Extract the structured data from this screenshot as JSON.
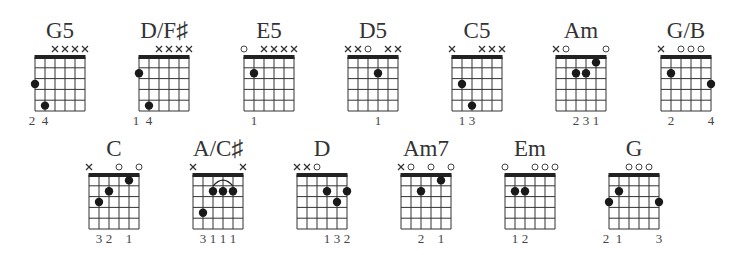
{
  "chart_data": {
    "type": "table",
    "strings": 6,
    "frets_shown": 5,
    "rows": [
      [
        {
          "name": "G5",
          "markers": [
            "",
            "",
            "x",
            "x",
            "x",
            "x"
          ],
          "dots": [
            [
              1,
              3
            ],
            [
              2,
              5
            ]
          ],
          "fingers": [
            "2",
            "4",
            "",
            "",
            "",
            ""
          ],
          "barre": null
        },
        {
          "name": "D/F♯",
          "markers": [
            "",
            "",
            "x",
            "x",
            "x",
            "x"
          ],
          "dots": [
            [
              1,
              2
            ],
            [
              2,
              5
            ]
          ],
          "fingers": [
            "1",
            "4",
            "",
            "",
            "",
            ""
          ],
          "barre": null
        },
        {
          "name": "E5",
          "markers": [
            "o",
            "",
            "x",
            "x",
            "x",
            "x"
          ],
          "dots": [
            [
              2,
              2
            ]
          ],
          "fingers": [
            "",
            "1",
            "",
            "",
            "",
            ""
          ],
          "barre": null
        },
        {
          "name": "D5",
          "markers": [
            "x",
            "x",
            "o",
            "",
            "x",
            "x"
          ],
          "dots": [
            [
              4,
              2
            ]
          ],
          "fingers": [
            "",
            "",
            "",
            "1",
            "",
            ""
          ],
          "barre": null
        },
        {
          "name": "C5",
          "markers": [
            "x",
            "",
            "",
            "x",
            "x",
            "x"
          ],
          "dots": [
            [
              2,
              3
            ],
            [
              3,
              5
            ]
          ],
          "fingers": [
            "",
            "1",
            "3",
            "",
            "",
            ""
          ],
          "barre": null
        },
        {
          "name": "Am",
          "markers": [
            "x",
            "o",
            "",
            "",
            "",
            "o"
          ],
          "dots": [
            [
              3,
              2
            ],
            [
              4,
              2
            ],
            [
              5,
              1
            ]
          ],
          "fingers": [
            "",
            "",
            "2",
            "3",
            "1",
            ""
          ],
          "barre": null
        },
        {
          "name": "G/B",
          "markers": [
            "x",
            "",
            "o",
            "o",
            "o",
            ""
          ],
          "dots": [
            [
              2,
              2
            ],
            [
              6,
              3
            ]
          ],
          "fingers": [
            "",
            "2",
            "",
            "",
            "",
            "4"
          ],
          "barre": null
        }
      ],
      [
        {
          "name": "C",
          "markers": [
            "x",
            "",
            "",
            "o",
            "",
            "o"
          ],
          "dots": [
            [
              2,
              3
            ],
            [
              3,
              2
            ],
            [
              5,
              1
            ]
          ],
          "fingers": [
            "",
            "3",
            "2",
            "",
            "1",
            ""
          ],
          "barre": null
        },
        {
          "name": "A/C♯",
          "markers": [
            "x",
            "",
            "",
            "",
            "",
            "x"
          ],
          "dots": [
            [
              2,
              4
            ],
            [
              3,
              2
            ],
            [
              4,
              2
            ],
            [
              5,
              2
            ]
          ],
          "fingers": [
            "",
            "3",
            "1",
            "1",
            "1",
            ""
          ],
          "barre": [
            3,
            5,
            2
          ]
        },
        {
          "name": "D",
          "markers": [
            "x",
            "x",
            "o",
            "",
            "",
            ""
          ],
          "dots": [
            [
              4,
              2
            ],
            [
              5,
              3
            ],
            [
              6,
              2
            ]
          ],
          "fingers": [
            "",
            "",
            "",
            "1",
            "3",
            "2"
          ],
          "barre": null
        },
        {
          "name": "Am7",
          "markers": [
            "x",
            "o",
            "",
            "o",
            "",
            "o"
          ],
          "dots": [
            [
              3,
              2
            ],
            [
              5,
              1
            ]
          ],
          "fingers": [
            "",
            "",
            "2",
            "",
            "1",
            ""
          ],
          "barre": null
        },
        {
          "name": "Em",
          "markers": [
            "o",
            "",
            "",
            "o",
            "o",
            "o"
          ],
          "dots": [
            [
              2,
              2
            ],
            [
              3,
              2
            ]
          ],
          "fingers": [
            "",
            "1",
            "2",
            "",
            "",
            ""
          ],
          "barre": null
        },
        {
          "name": "G",
          "markers": [
            "",
            "",
            "o",
            "o",
            "o",
            ""
          ],
          "dots": [
            [
              1,
              3
            ],
            [
              2,
              2
            ],
            [
              6,
              3
            ]
          ],
          "fingers": [
            "2",
            "1",
            "",
            "",
            "",
            "3"
          ],
          "barre": null
        }
      ]
    ]
  },
  "layout_positions": {
    "row1_top": 18,
    "row2_top": 136,
    "row1_lefts": [
      35,
      139,
      244,
      348,
      452,
      556,
      661
    ],
    "row2_lefts": [
      89,
      193,
      297,
      401,
      505,
      609
    ]
  }
}
